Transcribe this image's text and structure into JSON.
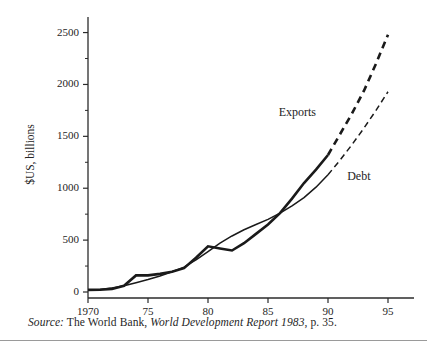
{
  "figure": {
    "ylabel": "$US, billions",
    "source_prefix": "Source:",
    "source_body": " The World Bank, ",
    "source_title": "World Development Report 1983",
    "source_suffix": ", p. 35."
  },
  "chart_data": {
    "type": "line",
    "title": "",
    "xlabel": "",
    "ylabel": "$US, billions",
    "xlim": [
      1970,
      1996
    ],
    "ylim": [
      0,
      2650
    ],
    "grid": false,
    "legend": "inline-annotations",
    "y_ticks_major": [
      0,
      500,
      1000,
      1500,
      2000,
      2500
    ],
    "y_tick_labels": [
      "0",
      "500",
      "1000",
      "1500",
      "2000",
      "2500"
    ],
    "y_ticks_minor": [
      250,
      750,
      1250,
      1750,
      2250
    ],
    "x_ticks": [
      1970,
      1975,
      1980,
      1985,
      1990,
      1995
    ],
    "x_tick_labels": [
      "1970",
      "75",
      "80",
      "85",
      "90",
      "95"
    ],
    "annotations": [
      {
        "text": "Exports",
        "x": 1989.0,
        "y": 1700,
        "anchor": "end"
      },
      {
        "text": "Debt",
        "x": 1991.6,
        "y": 1080,
        "anchor": "start"
      }
    ],
    "series": [
      {
        "name": "Exports",
        "style": "thick",
        "x": [
          1970,
          1971,
          1972,
          1973,
          1974,
          1975,
          1976,
          1977,
          1978,
          1979,
          1980,
          1981,
          1982,
          1983,
          1984,
          1985,
          1986,
          1987,
          1988,
          1989,
          1990,
          1991,
          1992,
          1993,
          1994,
          1995
        ],
        "values": [
          20,
          22,
          30,
          60,
          160,
          160,
          175,
          195,
          230,
          330,
          440,
          420,
          400,
          470,
          560,
          650,
          760,
          900,
          1050,
          1180,
          1320,
          1520,
          1720,
          1940,
          2200,
          2480
        ],
        "solid_until": 1990,
        "dashed_from": 1990
      },
      {
        "name": "Debt",
        "style": "thin",
        "x": [
          1970,
          1971,
          1972,
          1973,
          1974,
          1975,
          1976,
          1977,
          1978,
          1979,
          1980,
          1981,
          1982,
          1983,
          1984,
          1985,
          1986,
          1987,
          1988,
          1989,
          1990,
          1991,
          1992,
          1993,
          1994,
          1995
        ],
        "values": [
          18,
          25,
          38,
          60,
          90,
          120,
          155,
          195,
          240,
          310,
          390,
          470,
          540,
          600,
          650,
          700,
          760,
          830,
          910,
          1010,
          1130,
          1270,
          1420,
          1580,
          1750,
          1930
        ],
        "solid_until": 1990,
        "dashed_from": 1990
      }
    ]
  }
}
